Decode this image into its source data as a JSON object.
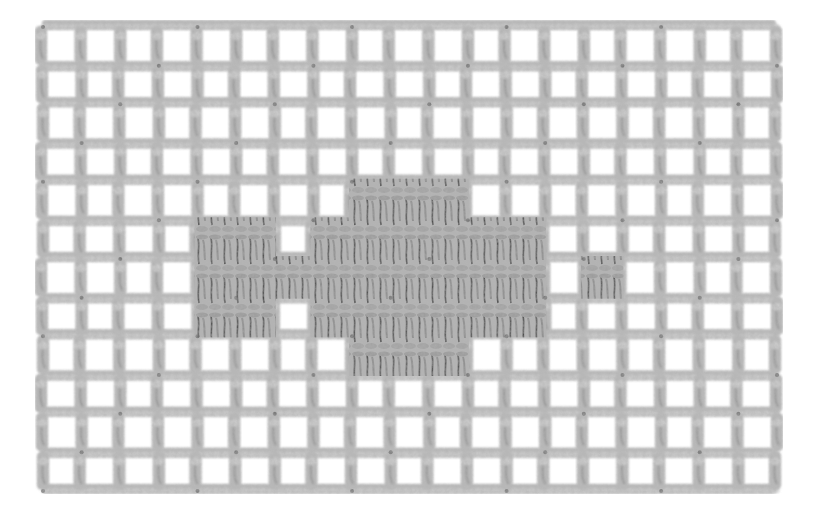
{
  "image": {
    "subject": "Filet crochet mesh swatch with a solid block motif",
    "description": "Grey yarn crocheted in an open square mesh on a white background, with a central filled arrow/cross-shaped block of solid double crochet stitches",
    "colors": {
      "background": "#ffffff",
      "yarn": "#b9b9b9",
      "yarn_shadow": "#8e8e8e",
      "yarn_highlight": "#d2d2d2",
      "stitch_gap": "#3a3a3a"
    },
    "mesh": {
      "left": 42,
      "top": 26,
      "right": 776,
      "bottom": 490,
      "columns": 19,
      "rows": 12
    },
    "filled_cells": [
      {
        "row": 4,
        "cols": [
          8,
          9,
          10
        ]
      },
      {
        "row": 5,
        "cols": [
          4,
          5,
          7,
          8,
          9,
          10,
          11,
          12
        ]
      },
      {
        "row": 6,
        "cols": [
          4,
          5,
          6,
          7,
          8,
          9,
          10,
          11,
          12,
          14
        ]
      },
      {
        "row": 7,
        "cols": [
          4,
          5,
          7,
          8,
          9,
          10,
          11,
          12
        ]
      },
      {
        "row": 8,
        "cols": [
          8,
          9,
          10
        ]
      }
    ]
  }
}
